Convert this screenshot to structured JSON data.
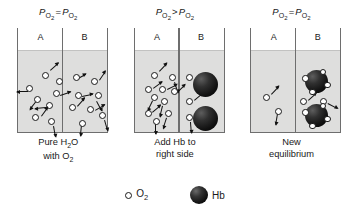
{
  "figure": {
    "legend": {
      "o2": {
        "icon": "open-circle-icon",
        "label_main": "O",
        "label_sub": "2"
      },
      "hb": {
        "icon": "filled-sphere-icon",
        "label": "Hb"
      }
    }
  },
  "panels": [
    {
      "id": "panel-1",
      "header": {
        "left_term": "P",
        "left_sub": "O2",
        "relation": "=",
        "right_term": "P",
        "right_sub": "O2",
        "text": "Po2 = Po2"
      },
      "chamber_a_label": "A",
      "chamber_b_label": "B",
      "caption_line1": "Pure H2O",
      "caption_line1_pre": "Pure H",
      "caption_line1_sub": "2",
      "caption_line1_post": "O",
      "caption_line2_pre": "with O",
      "caption_line2_sub": "2",
      "chamber_a": {
        "o2_count": 8,
        "hb_count": 0
      },
      "chamber_b": {
        "o2_count": 8,
        "hb_count": 0
      }
    },
    {
      "id": "panel-2",
      "header": {
        "left_term": "P",
        "left_sub": "O2",
        "relation": ">",
        "right_term": "P",
        "right_sub": "O2",
        "text": "Po2 > Po2"
      },
      "chamber_a_label": "A",
      "chamber_b_label": "B",
      "caption_line1": "Add Hb to",
      "caption_line2": "right side",
      "chamber_a": {
        "o2_count": 10,
        "hb_count": 0
      },
      "chamber_b": {
        "o2_count": 3,
        "hb_count": 2
      }
    },
    {
      "id": "panel-3",
      "header": {
        "left_term": "P",
        "left_sub": "O2",
        "relation": "=",
        "right_term": "P",
        "right_sub": "O2",
        "text": "Po2 = Po2"
      },
      "chamber_a_label": "A",
      "chamber_b_label": "B",
      "caption_line1": "New",
      "caption_line2": "equilibrium",
      "chamber_a": {
        "o2_count": 2,
        "hb_count": 0
      },
      "chamber_b": {
        "o2_count": 2,
        "hb_count": 2,
        "bound_o2_per_hb": 4
      }
    }
  ],
  "colors": {
    "liquid": "#dededd",
    "vessel_wall": "#6e6e6e",
    "molecule_outline": "#1a1a1a",
    "hb_fill": "#111111",
    "background": "#ffffff"
  },
  "molecules": {
    "panel1_a": [
      {
        "x": 22,
        "y": 20,
        "ax": 26,
        "ay": 14,
        "ar": -42
      },
      {
        "x": 36,
        "y": 26,
        "ax": 0,
        "ay": 0,
        "ar": null
      },
      {
        "x": 6,
        "y": 33,
        "ax": 4,
        "ay": 36,
        "ar": 180
      },
      {
        "x": 33,
        "y": 38,
        "ax": 36,
        "ay": 39,
        "ar": -18
      },
      {
        "x": 14,
        "y": 44,
        "ax": 13,
        "ay": 45,
        "ar": 128
      },
      {
        "x": 26,
        "y": 50,
        "ax": 22,
        "ay": 52,
        "ar": 175
      },
      {
        "x": 12,
        "y": 62,
        "ax": 17,
        "ay": 60,
        "ar": -54
      },
      {
        "x": 28,
        "y": 66,
        "ax": 30,
        "ay": 70,
        "ar": 80
      }
    ],
    "panel1_b": [
      {
        "x": 8,
        "y": 22,
        "ax": 7,
        "ay": 23,
        "ar": -28
      },
      {
        "x": 26,
        "y": 26,
        "ax": 30,
        "ay": 24,
        "ar": -56
      },
      {
        "x": 10,
        "y": 40,
        "ax": 13,
        "ay": 40,
        "ar": -12
      },
      {
        "x": 30,
        "y": 40,
        "ax": 28,
        "ay": 45,
        "ar": 62
      },
      {
        "x": 4,
        "y": 52,
        "ax": 8,
        "ay": 50,
        "ar": -48
      },
      {
        "x": 22,
        "y": 54,
        "ax": 26,
        "ay": 54,
        "ar": -30
      },
      {
        "x": 34,
        "y": 60,
        "ax": 36,
        "ay": 64,
        "ar": 74
      },
      {
        "x": 14,
        "y": 68,
        "ax": 13,
        "ay": 69,
        "ar": 96
      }
    ],
    "panel2_a": [
      {
        "x": 14,
        "y": 20,
        "ax": 18,
        "ay": 15,
        "ar": -46
      },
      {
        "x": 32,
        "y": 22,
        "ax": 34,
        "ay": 26,
        "ar": 72
      },
      {
        "x": 8,
        "y": 34,
        "ax": 12,
        "ay": 32,
        "ar": -36
      },
      {
        "x": 22,
        "y": 34,
        "ax": 26,
        "ay": 33,
        "ar": -26
      },
      {
        "x": 34,
        "y": 36,
        "ax": 36,
        "ay": 36,
        "ar": -44
      },
      {
        "x": 14,
        "y": 42,
        "ax": 12,
        "ay": 45,
        "ar": 116
      },
      {
        "x": 24,
        "y": 46,
        "ax": 22,
        "ay": 50,
        "ar": 104
      },
      {
        "x": 8,
        "y": 58,
        "ax": 11,
        "ay": 56,
        "ar": -40
      },
      {
        "x": 28,
        "y": 58,
        "ax": 26,
        "ay": 62,
        "ar": 108
      },
      {
        "x": 16,
        "y": 66,
        "ax": 15,
        "ay": 67,
        "ar": 90
      }
    ],
    "panel2_b": [
      {
        "x": 4,
        "y": 22,
        "ax": 0,
        "ay": 0,
        "ar": null
      },
      {
        "x": 4,
        "y": 46,
        "ax": 8,
        "ay": 44,
        "ar": -40
      },
      {
        "x": 4,
        "y": 62,
        "ax": 5,
        "ay": 66,
        "ar": 86
      }
    ],
    "panel3_a": [
      {
        "x": 10,
        "y": 42,
        "ax": 14,
        "ay": 38,
        "ar": -46
      },
      {
        "x": 22,
        "y": 56,
        "ax": 21,
        "ay": 58,
        "ar": 100
      }
    ],
    "panel3_b": [
      {
        "x": 2,
        "y": 46,
        "ax": 6,
        "ay": 44,
        "ar": -42
      },
      {
        "x": 22,
        "y": 46,
        "ax": 26,
        "ay": 47,
        "ar": 28
      }
    ]
  }
}
